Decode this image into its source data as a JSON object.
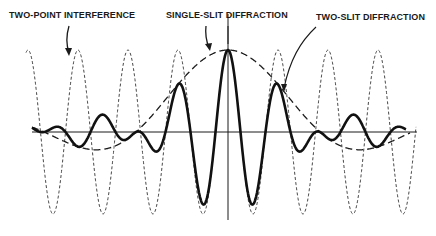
{
  "figure": {
    "labels": {
      "two_point": "TWO-POINT INTERFERENCE",
      "single_slit": "SINGLE-SLIT DIFFRACTION",
      "two_slit": "TWO-SLIT DIFFRACTION"
    },
    "colors": {
      "ink": "#1a1a1a",
      "background": "#ffffff"
    }
  },
  "chart_data": {
    "type": "line",
    "title": "",
    "xlabel": "",
    "ylabel": "",
    "axes": {
      "x_axis": true,
      "y_axis_at_center": true,
      "grid": false,
      "ticks": false
    },
    "series": [
      {
        "name": "TWO-POINT INTERFERENCE",
        "style": "fine-dashed",
        "description": "constant-amplitude cosine fringes, 8 maxima across the field"
      },
      {
        "name": "SINGLE-SLIT DIFFRACTION",
        "style": "long-dashed",
        "description": "diffraction envelope with central maximum and weak negative side lobes"
      },
      {
        "name": "TWO-SLIT DIFFRACTION",
        "style": "solid-heavy",
        "description": "product of interference fringes and single-slit envelope"
      }
    ]
  }
}
